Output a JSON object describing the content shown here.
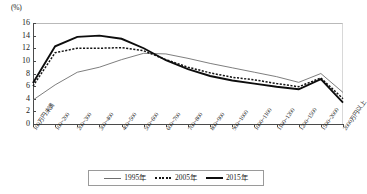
{
  "chart_data": {
    "type": "line",
    "title": "",
    "xlabel": "",
    "ylabel": "",
    "unit_label": "(%)",
    "ylim": [
      0,
      16
    ],
    "yticks": [
      0,
      2,
      4,
      6,
      8,
      10,
      12,
      14,
      16
    ],
    "grid": false,
    "legend_position": "bottom-center",
    "categories": [
      "100万円未満",
      "100~200",
      "200~300",
      "300~400",
      "400~500",
      "500~600",
      "600~700",
      "700~800",
      "800~900",
      "900~1000",
      "1000~1100",
      "1100~1200",
      "1200~1500",
      "1500~2000",
      "2000万円以上"
    ],
    "series": [
      {
        "name": "1995年",
        "style": "thin-solid",
        "color": "#6f6f6f",
        "values": [
          3.8,
          6.2,
          8.2,
          9.0,
          10.2,
          11.2,
          11.1,
          10.4,
          9.6,
          8.9,
          8.2,
          7.5,
          6.6,
          8.0,
          5.0
        ]
      },
      {
        "name": "2005年",
        "style": "dotted",
        "color": "#141414",
        "values": [
          6.0,
          11.3,
          12.0,
          12.0,
          12.1,
          11.6,
          10.2,
          9.0,
          8.1,
          7.4,
          7.0,
          6.4,
          5.9,
          7.3,
          4.0
        ]
      },
      {
        "name": "2015年",
        "style": "thick-solid",
        "color": "#0d0d0d",
        "values": [
          6.5,
          12.3,
          13.8,
          14.0,
          13.5,
          12.0,
          10.1,
          8.7,
          7.6,
          6.9,
          6.4,
          5.9,
          5.5,
          7.1,
          3.4
        ]
      }
    ]
  },
  "legend": {
    "items": [
      {
        "label": "1995年",
        "swatch": "thin-solid-line-swatch"
      },
      {
        "label": "2005年",
        "swatch": "dotted-line-swatch"
      },
      {
        "label": "2015年",
        "swatch": "thick-solid-line-swatch"
      }
    ]
  }
}
